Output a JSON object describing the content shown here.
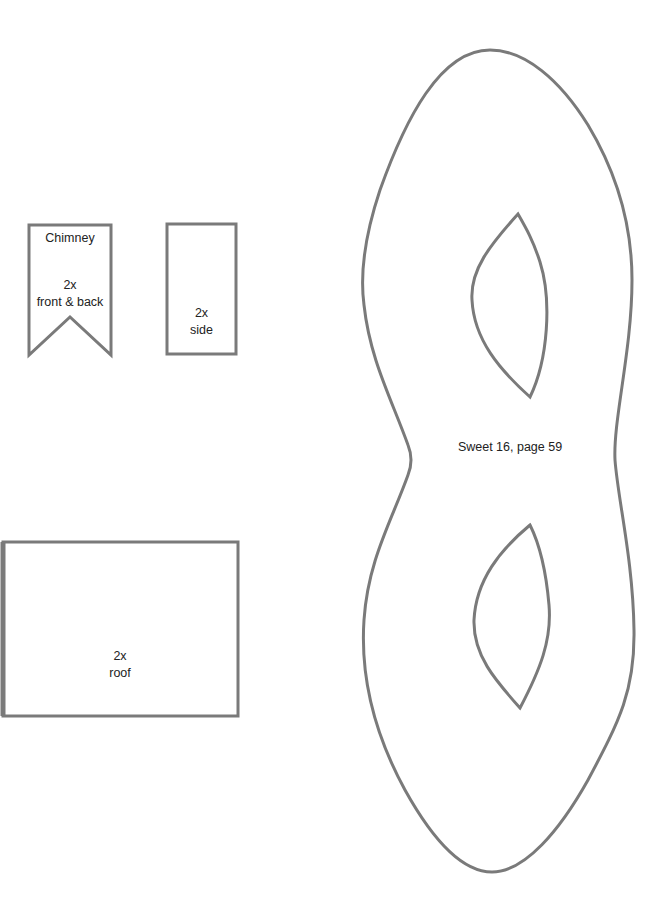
{
  "page": {
    "background": "#ffffff",
    "stroke_color": "#7a7a7a"
  },
  "pieces": {
    "chimney_front_back": {
      "title": "Chimney",
      "count": "2x",
      "name": "front & back"
    },
    "chimney_side": {
      "count": "2x",
      "name": "side"
    },
    "roof": {
      "count": "2x",
      "name": "roof"
    },
    "mask": {
      "caption": "Sweet 16, page 59"
    }
  }
}
